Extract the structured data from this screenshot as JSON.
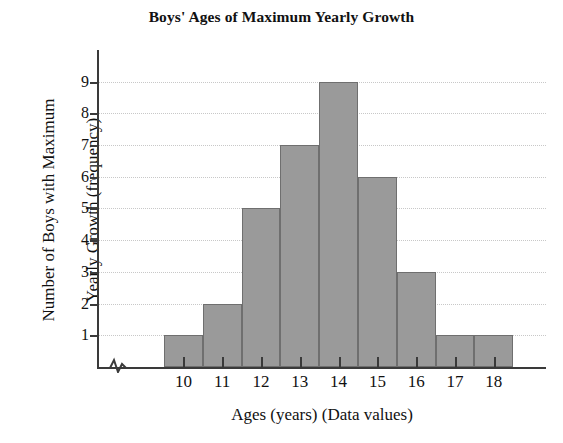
{
  "chart_data": {
    "type": "bar",
    "title": "Boys' Ages of Maximum Yearly Growth",
    "xlabel": "Ages (years) (Data values)",
    "ylabel": "Number of Boys with Maximum Yearly Growth (frequency)",
    "ylabel_lines": [
      "Number of Boys with Maximum",
      "Yearly Growth (frequency)"
    ],
    "categories": [
      "10",
      "11",
      "12",
      "13",
      "14",
      "15",
      "16",
      "17",
      "18"
    ],
    "values": [
      1,
      2,
      5,
      7,
      9,
      6,
      3,
      1,
      1
    ],
    "x_tick_labels": [
      "10",
      "11",
      "12",
      "13",
      "14",
      "15",
      "16",
      "17",
      "18"
    ],
    "y_tick_labels": [
      "1",
      "2",
      "3",
      "4",
      "5",
      "6",
      "7",
      "8",
      "9"
    ],
    "y_ticks": [
      1,
      2,
      3,
      4,
      5,
      6,
      7,
      8,
      9
    ],
    "ylim": [
      0,
      9.35
    ],
    "xlim": [
      9.5,
      18.5
    ],
    "grid": true,
    "grid_axis": "y",
    "legend": false,
    "legend_position": "none",
    "bar_color": "#9a9a9a",
    "bar_edge_color": "#6f6f6f",
    "axis_color": "#3a3a3a",
    "grid_color": "#c8c8c8",
    "has_x_axis_break": true,
    "axis_break_symbol": "zigzag"
  }
}
